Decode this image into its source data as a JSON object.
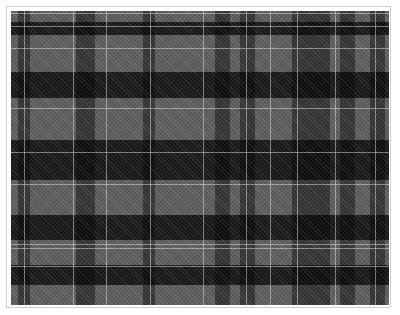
{
  "image": {
    "description": "Grayscale tartan plaid fabric swatch",
    "base_color": "#5e5e5e",
    "frame_border_color": "#cfcfcf",
    "pattern_origin": [
      11,
      11
    ],
    "pattern_size": [
      378,
      294
    ]
  },
  "stripes": {
    "dark_vertical": [
      [
        7,
        19
      ],
      [
        65,
        84
      ],
      [
        132,
        144
      ],
      [
        204,
        219
      ],
      [
        229,
        244
      ],
      [
        281,
        299
      ],
      [
        299,
        319
      ],
      [
        329,
        344
      ],
      [
        359,
        374
      ]
    ],
    "dark_horizontal": [
      [
        11,
        24
      ],
      [
        61,
        87
      ],
      [
        129,
        169
      ],
      [
        204,
        229
      ],
      [
        254,
        274
      ]
    ],
    "light_vertical": [
      13,
      62,
      95,
      139,
      192,
      235,
      259,
      286,
      324,
      364
    ],
    "light_horizontal": [
      2,
      15,
      37,
      97,
      141,
      173,
      233,
      237,
      255
    ],
    "dark_color": "rgba(20,20,20,0.55)",
    "dark_h_color": "rgba(70,70,70,1)",
    "light_color": "rgba(200,200,200,0.55)"
  }
}
